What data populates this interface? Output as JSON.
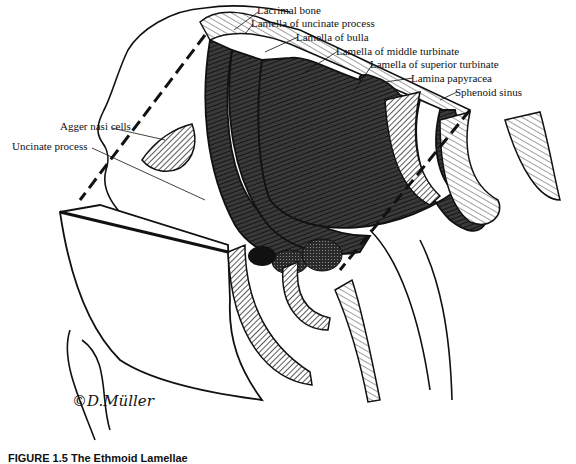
{
  "figure": {
    "type": "anatomical-illustration",
    "labels": [
      {
        "id": "lacrimal-bone",
        "text": "Lacrimal bone",
        "x": 257,
        "y": 4
      },
      {
        "id": "lamella-uncinate",
        "text": "Lamella of uncinate process",
        "x": 251,
        "y": 17
      },
      {
        "id": "lamella-bulla",
        "text": "Lamella of bulla",
        "x": 296,
        "y": 31
      },
      {
        "id": "lamella-middle-turbinate",
        "text": "Lamella of middle turbinate",
        "x": 336,
        "y": 45
      },
      {
        "id": "lamella-superior-turbinate",
        "text": "Lamella of superior turbinate",
        "x": 370,
        "y": 58
      },
      {
        "id": "lamina-papyracea",
        "text": "Lamina papyracea",
        "x": 411,
        "y": 72
      },
      {
        "id": "sphenoid-sinus",
        "text": "Sphenoid sinus",
        "x": 455,
        "y": 86
      },
      {
        "id": "agger-nasi-cells",
        "text": "Agger nasi cells",
        "x": 60,
        "y": 120
      },
      {
        "id": "uncinate-process",
        "text": "Uncinate process",
        "x": 12,
        "y": 140
      }
    ],
    "signature": "©D.Müller",
    "caption_partial": "FIGURE 1.5  The Ethmoid Lamellae"
  },
  "colors": {
    "ink": "#111111",
    "dark_fill": "#2a2a2a",
    "mid_fill": "#5a5a5a",
    "light_fill": "#b8b8b8",
    "paper": "#ffffff"
  }
}
